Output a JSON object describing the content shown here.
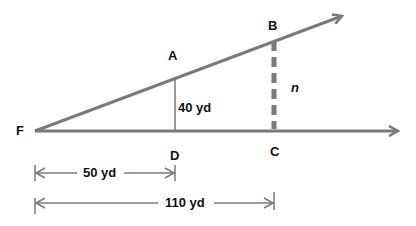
{
  "diagram": {
    "points": {
      "F": "F",
      "A": "A",
      "B": "B",
      "C": "C",
      "D": "D"
    },
    "labels": {
      "AD": "40 yd",
      "BC": "n",
      "FD": "50 yd",
      "FC": "110 yd"
    },
    "colors": {
      "line": "#7a7a7a",
      "text": "#111111"
    }
  }
}
